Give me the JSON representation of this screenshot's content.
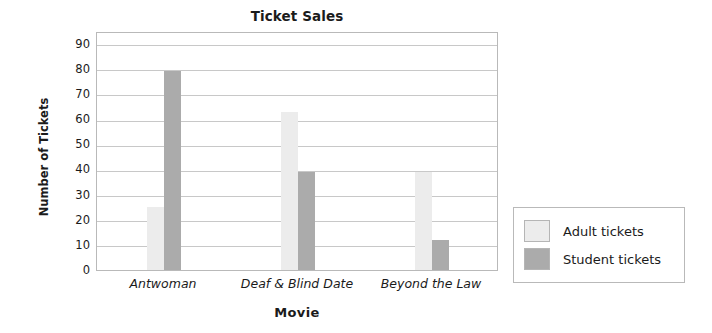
{
  "chart_data": {
    "type": "bar",
    "title": "Ticket Sales",
    "xlabel": "Movie",
    "ylabel": "Number of Tickets",
    "categories": [
      "Antwoman",
      "Deaf & Blind Date",
      "Beyond the Law"
    ],
    "series": [
      {
        "name": "Adult tickets",
        "color": "#ececec",
        "values": [
          25,
          63,
          39
        ]
      },
      {
        "name": "Student tickets",
        "color": "#ababab",
        "values": [
          79,
          39,
          12
        ]
      }
    ],
    "ylim": [
      0,
      95
    ],
    "yticks": [
      0,
      10,
      20,
      30,
      40,
      50,
      60,
      70,
      80,
      90
    ],
    "ytick_labels": [
      "0",
      "10",
      "20",
      "30",
      "40",
      "50",
      "60",
      "70",
      "80",
      "90"
    ],
    "grid": true,
    "legend_position": "right-outside"
  },
  "legend": {
    "entries": [
      {
        "label": "Adult tickets",
        "color": "#ececec"
      },
      {
        "label": "Student tickets",
        "color": "#ababab"
      }
    ]
  },
  "colors": {
    "adult": "#ececec",
    "student": "#ababab",
    "grid": "#c8c8c8",
    "axis_border": "#b9b9b9",
    "text": "#1b1b1b"
  }
}
